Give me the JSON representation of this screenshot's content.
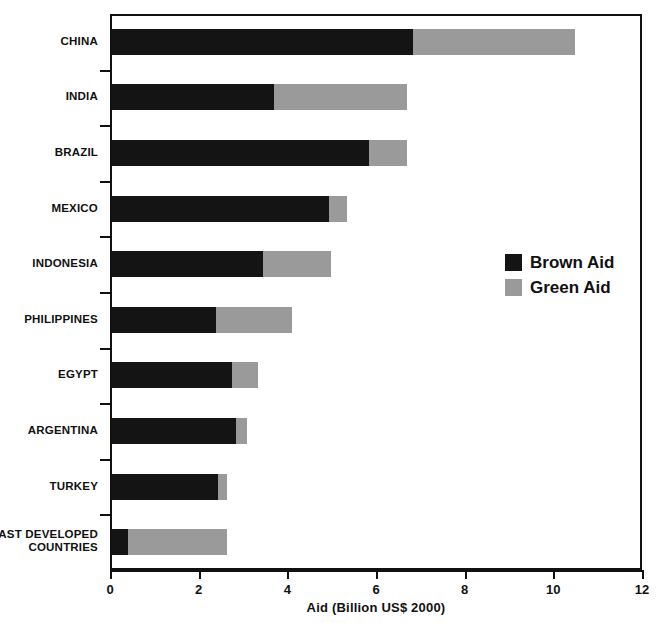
{
  "chart_data": {
    "type": "bar",
    "subtype": "horizontal-stacked",
    "title": "",
    "xlabel": "Aid (Billion US$ 2000)",
    "ylabel": "",
    "xlim": [
      0,
      12
    ],
    "xticks": [
      0,
      2,
      4,
      6,
      8,
      10,
      12
    ],
    "xtick_labels": [
      "0",
      "2",
      "4",
      "6",
      "8",
      "10",
      "12"
    ],
    "grid": false,
    "legend_position": "center-right",
    "categories": [
      "CHINA",
      "INDIA",
      "BRAZIL",
      "MEXICO",
      "INDONESIA",
      "PHILIPPINES",
      "EGYPT",
      "ARGENTINA",
      "TURKEY",
      "LEAST DEVELOPED\nCOUNTRIES"
    ],
    "series": [
      {
        "name": "Brown Aid",
        "color": "#141414",
        "values": [
          6.8,
          3.65,
          5.8,
          4.9,
          3.4,
          2.35,
          2.7,
          2.8,
          2.4,
          0.35
        ]
      },
      {
        "name": "Green Aid",
        "color": "#9a9a9a",
        "values": [
          3.65,
          3.0,
          0.85,
          0.4,
          1.55,
          1.7,
          0.6,
          0.25,
          0.2,
          2.25
        ]
      }
    ],
    "totals": [
      10.45,
      6.65,
      6.65,
      5.3,
      4.95,
      4.05,
      3.3,
      3.05,
      2.6,
      2.6
    ],
    "legend": [
      {
        "label": "Brown Aid",
        "color": "#141414"
      },
      {
        "label": "Green Aid",
        "color": "#9a9a9a"
      }
    ]
  }
}
